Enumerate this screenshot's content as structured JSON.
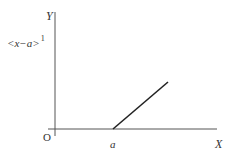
{
  "diagram": {
    "type": "ramp-function-plot",
    "y_axis_label": "Y",
    "x_axis_label": "X",
    "origin_label": "O",
    "function_label": {
      "base": "<x−a>",
      "exponent": "1"
    },
    "x_tick_label": "a",
    "colors": {
      "axis": "#555555",
      "ramp": "#222222",
      "text": "#333333"
    }
  }
}
